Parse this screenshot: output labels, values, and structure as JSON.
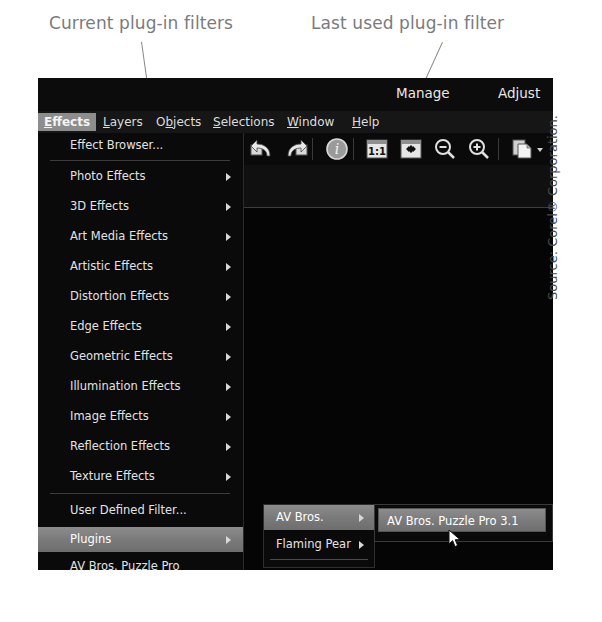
{
  "annotations": {
    "current_filters_label": "Current plug-in filters",
    "last_used_label": "Last used plug-in filter"
  },
  "window": {
    "workspace_tabs": [
      {
        "label": "Manage",
        "active": false
      },
      {
        "label": "Adjust",
        "active": false
      }
    ],
    "menubar": [
      {
        "label": "Effects",
        "mnemonic": "E",
        "active": true
      },
      {
        "label": "Layers",
        "mnemonic": "L",
        "active": false
      },
      {
        "label": "Objects",
        "mnemonic": "O",
        "active": false
      },
      {
        "label": "Selections",
        "mnemonic": "S",
        "active": false
      },
      {
        "label": "Window",
        "mnemonic": "W",
        "active": false
      },
      {
        "label": "Help",
        "mnemonic": "H",
        "active": false
      }
    ],
    "toolbar_icons": [
      "undo-icon",
      "redo-icon",
      "info-icon",
      "zoom-actual-size-icon",
      "fit-to-window-icon",
      "zoom-out-icon",
      "zoom-in-icon",
      "copy-icon",
      "dropdown-arrow-icon"
    ]
  },
  "effects_menu": {
    "items": [
      {
        "label": "Effect Browser...",
        "mnemonic": "w",
        "submenu": false,
        "highlight": false
      },
      {
        "label": "Photo Effects",
        "mnemonic": "P",
        "submenu": true,
        "highlight": false
      },
      {
        "label": "3D Effects",
        "mnemonic": "3",
        "submenu": true,
        "highlight": false
      },
      {
        "label": "Art Media Effects",
        "mnemonic": "M",
        "submenu": true,
        "highlight": false
      },
      {
        "label": "Artistic Effects",
        "mnemonic": "A",
        "submenu": true,
        "highlight": false
      },
      {
        "label": "Distortion Effects",
        "mnemonic": "D",
        "submenu": true,
        "highlight": false
      },
      {
        "label": "Edge Effects",
        "mnemonic": "E",
        "submenu": true,
        "highlight": false
      },
      {
        "label": "Geometric Effects",
        "mnemonic": "G",
        "submenu": true,
        "highlight": false
      },
      {
        "label": "Illumination Effects",
        "mnemonic": "I",
        "submenu": true,
        "highlight": false
      },
      {
        "label": "Image Effects",
        "mnemonic": "",
        "submenu": true,
        "highlight": false
      },
      {
        "label": "Reflection Effects",
        "mnemonic": "R",
        "submenu": true,
        "highlight": false
      },
      {
        "label": "Texture Effects",
        "mnemonic": "T",
        "submenu": true,
        "highlight": false
      },
      {
        "label": "User Defined Filter...",
        "mnemonic": "U",
        "submenu": false,
        "highlight": false
      },
      {
        "label": "Plugins",
        "mnemonic": "l",
        "submenu": true,
        "highlight": true
      },
      {
        "label": "AV Bros. Puzzle Pro",
        "mnemonic": "",
        "submenu": false,
        "highlight": false
      }
    ]
  },
  "plugins_submenu": {
    "items": [
      {
        "label": "AV Bros.",
        "submenu": true,
        "highlight": true
      },
      {
        "label": "Flaming Pear",
        "submenu": true,
        "highlight": false
      }
    ]
  },
  "avbros_submenu": {
    "items": [
      {
        "label": "AV Bros. Puzzle Pro 3.1",
        "highlight": true
      }
    ]
  },
  "credit": {
    "text": "Source: Corel® Corporation."
  },
  "colors": {
    "window_bg": "#060606",
    "menu_bg": "#0a0a0a",
    "highlight": "#7a7a7a",
    "text": "#e2e2e2",
    "callout": "#7b7b7b"
  }
}
